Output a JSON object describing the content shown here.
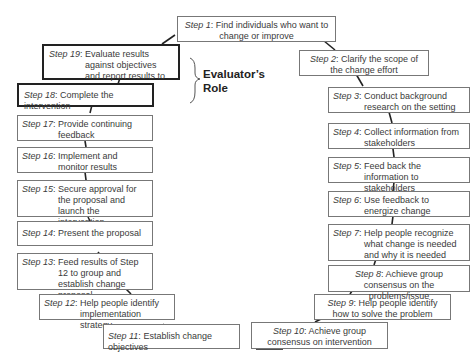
{
  "diagram": {
    "role_label_line1": "Evaluator’s",
    "role_label_line2": "Role",
    "steps": [
      {
        "label": "Step 1",
        "text": "Find individuals who want to change or improve"
      },
      {
        "label": "Step 2",
        "text": "Clarify the scope of the change effort"
      },
      {
        "label": "Step 3",
        "text": "Conduct background research on the setting"
      },
      {
        "label": "Step 4",
        "text": "Collect information from stakeholders"
      },
      {
        "label": "Step 5",
        "text": "Feed back the information to stakeholders"
      },
      {
        "label": "Step 6",
        "text": "Use feedback to energize change"
      },
      {
        "label": "Step 7",
        "text": "Help people recognize what change is needed and why it is needed"
      },
      {
        "label": "Step 8",
        "text": "Achieve group consensus on the problems/issue"
      },
      {
        "label": "Step 9",
        "text": "Help people identify how to solve the problem"
      },
      {
        "label": "Step 10",
        "text": "Achieve group consensus on intervention"
      },
      {
        "label": "Step 11",
        "text": "Establish change objectives"
      },
      {
        "label": "Step 12",
        "text": "Help people identify implementation strategy"
      },
      {
        "label": "Step 13",
        "text": "Feed results of Step 12 to group and establish change proposal"
      },
      {
        "label": "Step 14",
        "text": "Present the proposal"
      },
      {
        "label": "Step 15",
        "text": "Secure approval for the proposal and launch the intervention"
      },
      {
        "label": "Step 16",
        "text": "Implement and monitor results"
      },
      {
        "label": "Step 17",
        "text": "Provide continuing feedback"
      },
      {
        "label": "Step 18",
        "text": "Complete the intervention"
      },
      {
        "label": "Step 19",
        "text": "Evaluate results against objectives and report results to key stakeholders"
      }
    ]
  }
}
